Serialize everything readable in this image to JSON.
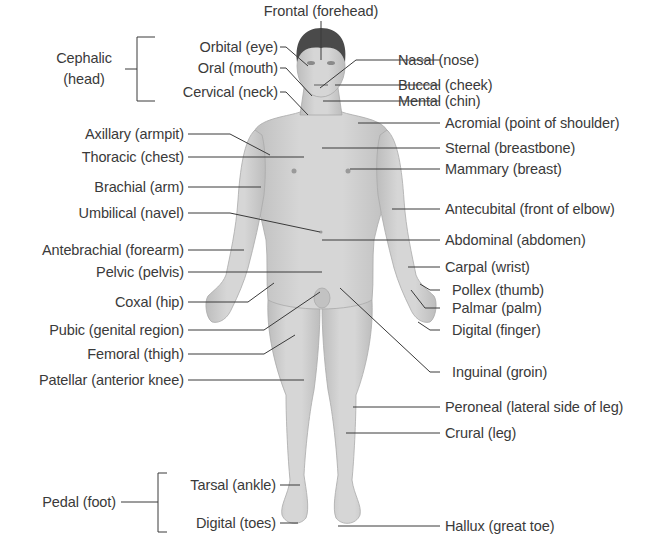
{
  "diagram": {
    "title_top": "Frontal (forehead)",
    "groups": {
      "cephalic": {
        "label_line1": "Cephalic",
        "label_line2": "(head)"
      },
      "pedal": {
        "label": "Pedal (foot)"
      }
    },
    "left_labels": {
      "orbital": "Orbital (eye)",
      "oral": "Oral (mouth)",
      "cervical": "Cervical (neck)",
      "axillary": "Axillary (armpit)",
      "thoracic": "Thoracic (chest)",
      "brachial": "Brachial (arm)",
      "umbilical": "Umbilical (navel)",
      "antebrachial": "Antebrachial (forearm)",
      "pelvic": "Pelvic (pelvis)",
      "coxal": "Coxal (hip)",
      "pubic": "Pubic (genital region)",
      "femoral": "Femoral (thigh)",
      "patellar": "Patellar (anterior knee)",
      "tarsal": "Tarsal (ankle)",
      "digital_toes": "Digital (toes)"
    },
    "right_labels": {
      "nasal": "Nasal (nose)",
      "buccal": "Buccal (cheek)",
      "mental": "Mental (chin)",
      "acromial": "Acromial (point of shoulder)",
      "sternal": "Sternal (breastbone)",
      "mammary": "Mammary (breast)",
      "antecubital": "Antecubital (front of elbow)",
      "abdominal": "Abdominal (abdomen)",
      "carpal": "Carpal (wrist)",
      "pollex": "Pollex (thumb)",
      "palmar": "Palmar (palm)",
      "digital_finger": "Digital (finger)",
      "inguinal": "Inguinal (groin)",
      "peroneal": "Peroneal (lateral side of leg)",
      "crural": "Crural (leg)",
      "hallux": "Hallux (great toe)"
    },
    "colors": {
      "skin": "#cfcfcf",
      "skin_shade": "#b5b5b5",
      "hair": "#4a4a4a",
      "line": "#3a3a3a",
      "text": "#3a3a3a",
      "background": "#ffffff"
    }
  }
}
